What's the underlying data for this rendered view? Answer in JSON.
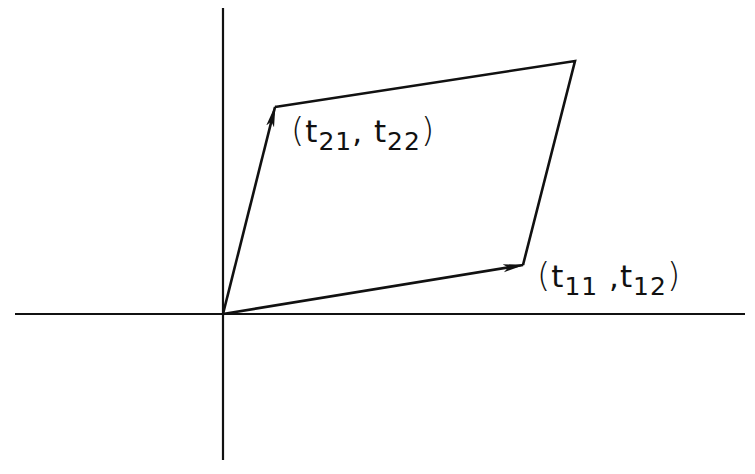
{
  "diagram": {
    "colors": {
      "background": "#ffffff",
      "stroke": "#111111"
    },
    "axes": {
      "origin": [
        223,
        314
      ],
      "x_axis": {
        "from": [
          15,
          314
        ],
        "to": [
          745,
          314
        ]
      },
      "y_axis": {
        "from": [
          223,
          8
        ],
        "to": [
          223,
          460
        ]
      }
    },
    "vectors": [
      {
        "id": "t1",
        "from": [
          223,
          314
        ],
        "to": [
          523,
          265
        ],
        "label": {
          "open": "(",
          "var1": "t",
          "sub1": "11",
          "sep": ",",
          "var2": "t",
          "sub2": "12",
          "close": ")"
        }
      },
      {
        "id": "t2",
        "from": [
          223,
          314
        ],
        "to": [
          275,
          107
        ],
        "label": {
          "open": "(",
          "var1": "t",
          "sub1": "21",
          "sep": ",",
          "var2": "t",
          "sub2": "22",
          "close": ")"
        }
      }
    ],
    "parallelogram": {
      "vertices": [
        [
          223,
          314
        ],
        [
          523,
          265
        ],
        [
          575,
          61
        ],
        [
          275,
          107
        ]
      ]
    }
  }
}
